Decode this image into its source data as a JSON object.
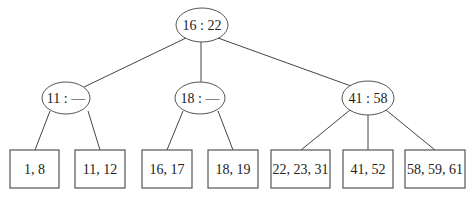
{
  "diagram": {
    "type": "2-3 tree",
    "root": {
      "label": "16 : 22"
    },
    "internal": [
      {
        "label": "11 : —"
      },
      {
        "label": "18 : —"
      },
      {
        "label": "41 : 58"
      }
    ],
    "leaves": [
      {
        "label": "1, 8"
      },
      {
        "label": "11, 12"
      },
      {
        "label": "16, 17"
      },
      {
        "label": "18, 19"
      },
      {
        "label": "22, 23, 31"
      },
      {
        "label": "41, 52"
      },
      {
        "label": "58, 59, 61"
      }
    ],
    "colors": {
      "stroke": "#555555",
      "text": "#222222",
      "background": "#ffffff"
    }
  }
}
